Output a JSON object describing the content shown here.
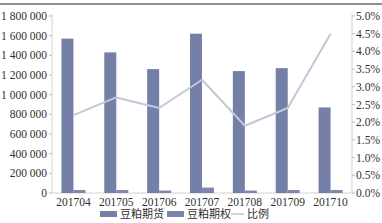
{
  "chart_data": {
    "type": "bar",
    "combo": "grouped bar (left axis) + line (right axis)",
    "title": "",
    "xlabel": "",
    "ylabel": "",
    "ylabel_right": "",
    "categories": [
      "201704",
      "201705",
      "201706",
      "201707",
      "201708",
      "201709",
      "201710"
    ],
    "series": [
      {
        "name": "豆粕期货",
        "type": "bar",
        "axis": "left",
        "color": "#7480a8",
        "values": [
          1570000,
          1430000,
          1260000,
          1620000,
          1240000,
          1270000,
          870000
        ]
      },
      {
        "name": "豆粕期权",
        "type": "bar",
        "axis": "left",
        "color": "#7b87ae",
        "values": [
          30000,
          30000,
          25000,
          55000,
          25000,
          30000,
          30000
        ]
      },
      {
        "name": "比例",
        "type": "line",
        "axis": "right",
        "color": "#c3c8d8",
        "unit": "%",
        "values": [
          2.2,
          2.7,
          2.4,
          3.2,
          1.9,
          2.4,
          4.5
        ]
      }
    ],
    "y_left": {
      "min": 0,
      "max": 1800000,
      "step": 200000,
      "ticks": [
        "0",
        "200 000",
        "400 000",
        "600 000",
        "800 000",
        "1 000 000",
        "1 200 000",
        "1 400 000",
        "1 600 000",
        "1 800 000"
      ]
    },
    "y_right": {
      "min": 0,
      "max": 5.0,
      "step": 0.5,
      "ticks": [
        "0.0%",
        "0.5%",
        "1.0%",
        "1.5%",
        "2.0%",
        "2.5%",
        "3.0%",
        "3.5%",
        "4.0%",
        "4.5%",
        "5.0%"
      ]
    },
    "ylim": [
      0,
      1800000
    ],
    "ylim_right": [
      0,
      5.0
    ],
    "grid": false,
    "legend_position": "bottom"
  }
}
